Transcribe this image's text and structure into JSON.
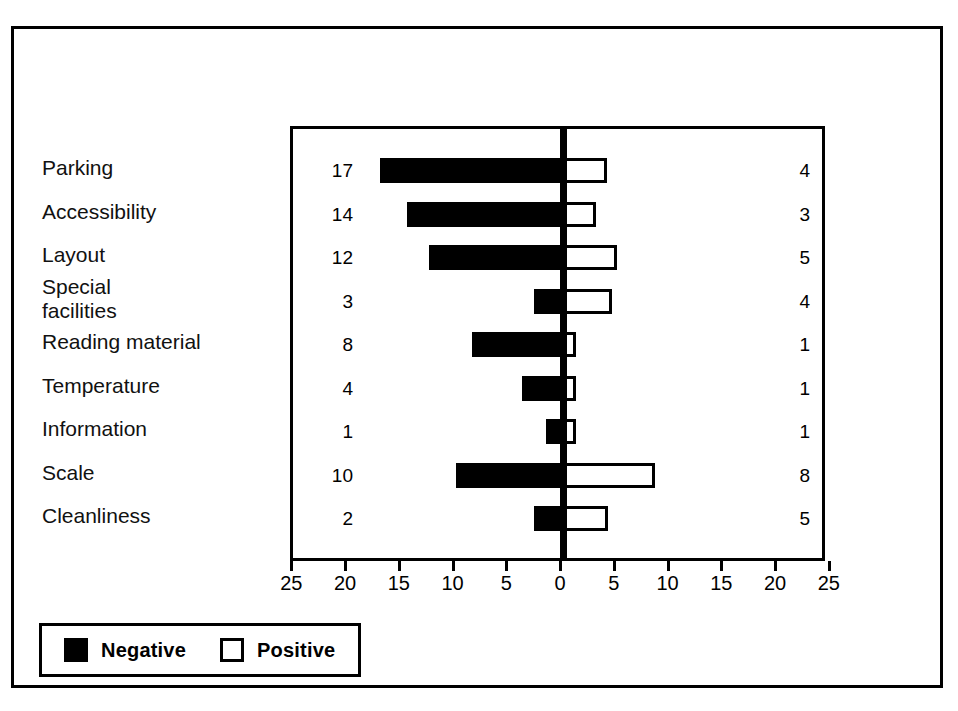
{
  "chart_data": {
    "type": "bar",
    "orientation": "horizontal",
    "style": "diverging-bar",
    "title": "",
    "subtitle": "",
    "xlabel": "",
    "ylabel": "",
    "xlim": [
      -25,
      25
    ],
    "grid": false,
    "axis_ticks": [
      "25",
      "20",
      "15",
      "10",
      "5",
      "0",
      "5",
      "10",
      "15",
      "20",
      "25"
    ],
    "axis_tick_values": [
      -25,
      -20,
      -15,
      -10,
      -5,
      0,
      5,
      10,
      15,
      20,
      25
    ],
    "legend_position": "bottom-left",
    "categories": [
      "Parking",
      "Accessibility",
      "Layout",
      "Special facilities",
      "Reading material",
      "Temperature",
      "Information",
      "Scale",
      "Cleanliness"
    ],
    "category_lines": [
      [
        "Parking"
      ],
      [
        "Accessibility"
      ],
      [
        "Layout"
      ],
      [
        "Special",
        "facilities"
      ],
      [
        "Reading material"
      ],
      [
        "Temperature"
      ],
      [
        "Information"
      ],
      [
        "Scale"
      ],
      [
        "Cleanliness"
      ]
    ],
    "series": [
      {
        "name": "Negative",
        "color": "#000000",
        "fill": "solid",
        "values": [
          17,
          14,
          12,
          3,
          8,
          4,
          1,
          10,
          2
        ],
        "bar_extent_units": [
          17.0,
          14.5,
          12.5,
          2.7,
          8.5,
          3.8,
          1.6,
          10.0,
          2.7
        ]
      },
      {
        "name": "Positive",
        "color": "#ffffff",
        "fill": "outline",
        "values": [
          4,
          3,
          5,
          4,
          1,
          1,
          1,
          8,
          5
        ],
        "bar_extent_units": [
          4.1,
          3.1,
          5.0,
          4.6,
          1.2,
          1.2,
          1.2,
          8.6,
          4.2
        ]
      }
    ],
    "data_labels": {
      "left_column": [
        "17",
        "14",
        "12",
        "3",
        "8",
        "4",
        "1",
        "10",
        "2"
      ],
      "right_column": [
        "4",
        "3",
        "5",
        "4",
        "1",
        "1",
        "1",
        "8",
        "5"
      ]
    }
  },
  "legend": {
    "items": [
      {
        "label": "Negative",
        "swatch": "filled-black-square"
      },
      {
        "label": "Positive",
        "swatch": "hollow-square"
      }
    ]
  }
}
